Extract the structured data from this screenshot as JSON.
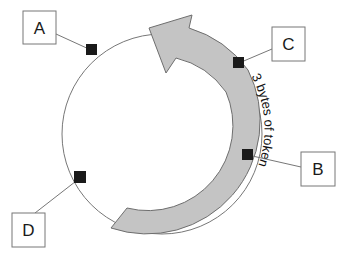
{
  "diagram": {
    "arrow_label": "3 bytes of token",
    "colors": {
      "background": "#ffffff",
      "ring_stroke": "#777777",
      "arrow_fill": "#c4c4c4",
      "arrow_stroke": "#6e6e6e",
      "station_fill": "#1a1a1a",
      "box_stroke": "#777777"
    },
    "stations": [
      {
        "id": "A",
        "label": "A"
      },
      {
        "id": "B",
        "label": "B"
      },
      {
        "id": "C",
        "label": "C"
      },
      {
        "id": "D",
        "label": "D"
      }
    ]
  }
}
